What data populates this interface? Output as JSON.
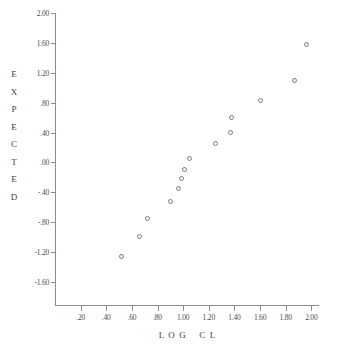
{
  "chart_data": {
    "type": "scatter",
    "title": "",
    "xlabel": "L O G   C L",
    "ylabel": "EXPECTED",
    "xlim": [
      0.0,
      2.06
    ],
    "ylim": [
      -1.92,
      2.0
    ],
    "grid": false,
    "legend": null,
    "x_ticks": [
      0.2,
      0.4,
      0.6,
      0.8,
      1.0,
      1.2,
      1.4,
      1.6,
      1.8,
      2.0
    ],
    "x_tick_labels": [
      ".20",
      ".40",
      ".60",
      ".80",
      "1.00",
      "1.20",
      "1.40",
      "1.60",
      "1.80",
      "2.00"
    ],
    "y_ticks": [
      2.0,
      1.6,
      1.2,
      0.8,
      0.4,
      0.0,
      -0.4,
      -0.8,
      -1.2,
      -1.6
    ],
    "y_tick_labels": [
      "2.00",
      "1.60",
      "1.20",
      ".80",
      ".40",
      ".00",
      "-.40",
      "-.80",
      "-1.20",
      "-1.60"
    ],
    "points": [
      {
        "x": 0.52,
        "y": -1.26
      },
      {
        "x": 0.66,
        "y": -0.99
      },
      {
        "x": 0.72,
        "y": -0.75
      },
      {
        "x": 0.9,
        "y": -0.52
      },
      {
        "x": 0.96,
        "y": -0.35
      },
      {
        "x": 0.99,
        "y": -0.21
      },
      {
        "x": 1.01,
        "y": -0.1
      },
      {
        "x": 1.05,
        "y": 0.05
      },
      {
        "x": 1.25,
        "y": 0.25
      },
      {
        "x": 1.37,
        "y": 0.4
      },
      {
        "x": 1.38,
        "y": 0.6
      },
      {
        "x": 1.6,
        "y": 0.83
      },
      {
        "x": 1.87,
        "y": 1.1
      },
      {
        "x": 1.96,
        "y": 1.58
      }
    ],
    "marker": "open-circle",
    "marker_color": "#7a7a7a",
    "axis_color": "#8c8c8c",
    "background": "#ffffff"
  },
  "axis_titles": {
    "y_letters": [
      "E",
      "X",
      "P",
      "E",
      "C",
      "T",
      "E",
      "D"
    ],
    "x_title": "L  O  G      C  L"
  }
}
